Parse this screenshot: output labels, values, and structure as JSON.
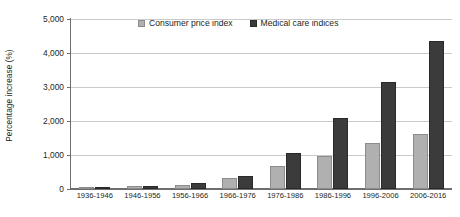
{
  "chart_data": {
    "type": "bar",
    "title": "",
    "xlabel": "",
    "ylabel": "Percentage increase (%)",
    "ylim": [
      0,
      5000
    ],
    "ytick_labels": [
      "5,000",
      "4,000",
      "3,000",
      "2,000",
      "1,000",
      "0"
    ],
    "ytick_values": [
      5000,
      4000,
      3000,
      2000,
      1000,
      0
    ],
    "grid": true,
    "legend_position": "top-center",
    "categories": [
      "1936-1946",
      "1946-1956",
      "1956-1966",
      "1966-1976",
      "1976-1986",
      "1986-1996",
      "1996-2006",
      "2006-2016"
    ],
    "series": [
      {
        "name": "Consumer price index",
        "color": "#b0b0b0",
        "values": [
          50,
          80,
          130,
          320,
          690,
          980,
          1340,
          1610
        ]
      },
      {
        "name": "Medical care indices",
        "color": "#3b3b3b",
        "values": [
          45,
          90,
          180,
          390,
          1050,
          2100,
          3150,
          4350
        ]
      }
    ]
  },
  "legend": {
    "items": [
      {
        "label": "Consumer price index",
        "swatch": "cpi"
      },
      {
        "label": "Medical care indices",
        "swatch": "medical"
      }
    ]
  }
}
